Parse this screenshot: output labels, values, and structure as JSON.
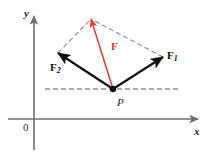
{
  "figure": {
    "type": "vector-parallelogram-diagram",
    "background_color": "#ffffff",
    "axes": {
      "y_label": "y",
      "x_label": "x",
      "origin_label": "0",
      "axis_color": "#6e6e6e",
      "y_axis": {
        "x": 34,
        "top_y": 16,
        "bottom_y": 150
      },
      "x_axis": {
        "y": 119,
        "left_x": 8,
        "right_x": 198
      }
    },
    "point": {
      "name": "P",
      "label": "P",
      "x": 113,
      "y": 89,
      "color": "#111111"
    },
    "vectors": [
      {
        "name": "F1",
        "label": "F",
        "subscript": "1",
        "color": "#111111",
        "from_x": 113,
        "from_y": 89,
        "to_x": 163,
        "to_y": 57,
        "label_x": 167,
        "label_y": 50
      },
      {
        "name": "F2",
        "label": "F",
        "subscript": "2",
        "color": "#111111",
        "from_x": 113,
        "from_y": 89,
        "to_x": 58,
        "to_y": 53,
        "label_x": 50,
        "label_y": 62
      },
      {
        "name": "F",
        "label": "F",
        "subscript": "",
        "color": "#e8372c",
        "from_x": 113,
        "from_y": 89,
        "to_x": 91,
        "to_y": 19,
        "label_x": 111,
        "label_y": 41
      }
    ],
    "dashed_lines": [
      {
        "name": "parallelogram-side-left",
        "x1": 58,
        "y1": 53,
        "x2": 91,
        "y2": 19,
        "color": "#8a8a8a"
      },
      {
        "name": "parallelogram-side-right",
        "x1": 163,
        "y1": 57,
        "x2": 91,
        "y2": 19,
        "color": "#8a8a8a"
      },
      {
        "name": "horizontal-reference",
        "x1": 45,
        "y1": 89,
        "x2": 178,
        "y2": 89,
        "color": "#555555"
      }
    ]
  }
}
